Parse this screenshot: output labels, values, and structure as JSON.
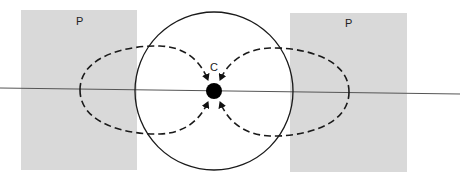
{
  "diagram": {
    "labels": {
      "center": "C",
      "left_region": "P",
      "right_region": "P"
    },
    "colors": {
      "background": "#ffffff",
      "region_fill": "#d9d9d9",
      "stroke": "#1a1a1a",
      "axis": "#555555",
      "center_dot": "#000000"
    },
    "elements": [
      {
        "type": "rect",
        "name": "left-region-P"
      },
      {
        "type": "rect",
        "name": "right-region-P"
      },
      {
        "type": "line",
        "name": "horizontal-axis"
      },
      {
        "type": "circle",
        "name": "outer-circle"
      },
      {
        "type": "dashed-loop",
        "name": "left-field-loop",
        "direction": "toward center C"
      },
      {
        "type": "dashed-loop",
        "name": "right-field-loop",
        "direction": "toward center C"
      },
      {
        "type": "dot",
        "name": "center-point-C"
      }
    ]
  }
}
